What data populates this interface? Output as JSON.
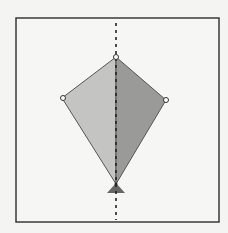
{
  "diagram": {
    "title": "",
    "shape": "kite",
    "frame": {
      "x": 16,
      "y": 18,
      "width": 203,
      "height": 204,
      "stroke": "#3a3a3a"
    },
    "symmetry_line": {
      "x": 116,
      "y1": 23,
      "y2": 220,
      "stroke": "#222222",
      "style": "dashed"
    },
    "vertices": {
      "top": {
        "x": 116,
        "y": 57
      },
      "left": {
        "x": 62,
        "y": 98
      },
      "right": {
        "x": 166,
        "y": 100
      },
      "bottom": {
        "x": 116,
        "y": 184
      }
    },
    "colors": {
      "left_half_fill": "#c4c4c2",
      "right_half_fill": "#9a9a98",
      "edge_stroke": "#555555",
      "base_triangle_fill": "#666666",
      "background": "#f4f4f2"
    },
    "pivot_triangle": {
      "apex_x": 116,
      "apex_y": 183,
      "base_y": 193,
      "half_width": 9
    }
  }
}
